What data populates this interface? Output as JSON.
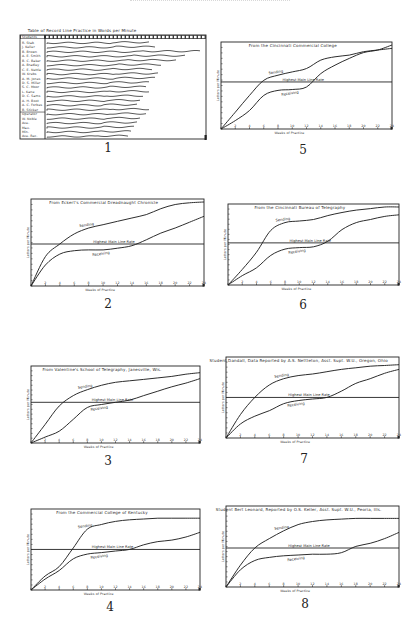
{
  "page": {
    "figure_numbers": [
      "1",
      "2",
      "3",
      "4",
      "5",
      "6",
      "7",
      "8"
    ]
  },
  "chart_data": [
    {
      "id": "fig1",
      "number": "1",
      "type": "table",
      "title": "Table of Record Line Practice in Words per Minute",
      "columns_header": "Students",
      "rows": [
        "R. Stab",
        "J. Keller",
        "B. Brown",
        "A. E. Smith",
        "B. C. Baker",
        "A. Bradley",
        "C. E. Nettle",
        "W. Krebs",
        "A. M. Jones",
        "D. S. Miller",
        "S. C. Moor",
        "L. Kane",
        "D. C. Sams",
        "A. H. Boot",
        "A. C. Forbes",
        "B. Sticker",
        "Operator",
        "W. Noble",
        "Ave.",
        "Max.",
        "Min.",
        "Ave. Rec."
      ],
      "note": "Wavy traces per student showing daily practice records across weeks"
    },
    {
      "id": "fig5",
      "number": "5",
      "type": "line",
      "title": "From the Cincinnati Commercial College",
      "xlabel": "Weeks of Practice",
      "ylabel": "Letters per Minute",
      "x": [
        0,
        1,
        2,
        3,
        4,
        5,
        6,
        7,
        8,
        9,
        10,
        11,
        12
      ],
      "threshold_label": "Highest Main Line Rate",
      "threshold": 56,
      "series": [
        {
          "name": "Sending",
          "values": [
            0,
            20,
            40,
            58,
            64,
            68,
            72,
            82,
            86,
            88,
            92,
            94,
            96
          ]
        },
        {
          "name": "Receiving",
          "values": [
            0,
            10,
            22,
            40,
            46,
            47,
            50,
            66,
            76,
            84,
            91,
            94,
            100
          ]
        }
      ],
      "ylim": [
        0,
        100
      ]
    },
    {
      "id": "fig2",
      "number": "2",
      "type": "line",
      "title": "From Eckert's Commercial Dreadnaught Chronicle",
      "xlabel": "Weeks of Practice",
      "ylabel": "Letters per Minute",
      "x": [
        0,
        1,
        2,
        3,
        4,
        5,
        6,
        7,
        8,
        9,
        10,
        11,
        12
      ],
      "threshold_label": "Highest Main Line Rate",
      "threshold": 50,
      "series": [
        {
          "name": "Sending",
          "values": [
            0,
            35,
            50,
            62,
            69,
            73,
            77,
            81,
            85,
            92,
            97,
            99,
            100
          ]
        },
        {
          "name": "Receiving",
          "values": [
            0,
            25,
            38,
            42,
            43,
            43,
            45,
            48,
            55,
            63,
            69,
            76,
            83
          ]
        }
      ],
      "ylim": [
        0,
        100
      ]
    },
    {
      "id": "fig6",
      "number": "6",
      "type": "line",
      "title": "From the Cincinnati Bureau of Telegraphy",
      "xlabel": "Weeks of Practice",
      "ylabel": "Letters per Minute",
      "x": [
        0,
        1,
        2,
        3,
        4,
        5,
        6,
        7,
        8,
        9,
        10,
        11,
        12
      ],
      "threshold_label": "Highest Main Line Rate",
      "threshold": 54,
      "series": [
        {
          "name": "Sending",
          "values": [
            0,
            20,
            42,
            70,
            80,
            82,
            84,
            89,
            93,
            96,
            98,
            100,
            100
          ]
        },
        {
          "name": "Receiving",
          "values": [
            0,
            12,
            22,
            38,
            46,
            48,
            49,
            56,
            71,
            80,
            84,
            88,
            90
          ]
        }
      ],
      "ylim": [
        0,
        100
      ]
    },
    {
      "id": "fig3",
      "number": "3",
      "type": "line",
      "title": "From Valentine's School of Telegraphy, Janesville, Wis.",
      "xlabel": "Weeks of Practice",
      "ylabel": "Letters per Minute",
      "x": [
        0,
        1,
        2,
        3,
        4,
        5,
        6,
        7,
        8,
        9,
        10,
        11,
        12
      ],
      "threshold_label": "Highest Main Line Rate",
      "threshold": 55,
      "series": [
        {
          "name": "Sending",
          "values": [
            0,
            25,
            50,
            64,
            72,
            78,
            82,
            84,
            86,
            88,
            90,
            93,
            95
          ]
        },
        {
          "name": "Receiving",
          "values": [
            0,
            8,
            16,
            32,
            48,
            52,
            55,
            58,
            64,
            70,
            76,
            81,
            87
          ]
        }
      ],
      "ylim": [
        0,
        100
      ]
    },
    {
      "id": "fig7",
      "number": "7",
      "type": "line",
      "title": "Student Dandall, Data Reported by A.S. Nettleton, Asst. Supt. W.U., Oregon, Ohio",
      "xlabel": "Weeks of Practice",
      "ylabel": "Letters per Minute",
      "x": [
        0,
        1,
        2,
        3,
        4,
        5,
        6,
        7,
        8,
        9,
        10,
        11,
        12
      ],
      "threshold_label": "Highest Main Line Rate",
      "threshold": 52,
      "series": [
        {
          "name": "Sending",
          "values": [
            0,
            30,
            52,
            68,
            76,
            80,
            82,
            85,
            88,
            90,
            92,
            93,
            94
          ]
        },
        {
          "name": "Receiving",
          "values": [
            0,
            18,
            28,
            35,
            44,
            48,
            50,
            52,
            60,
            70,
            76,
            83,
            88
          ]
        }
      ],
      "ylim": [
        0,
        100
      ]
    },
    {
      "id": "fig4",
      "number": "4",
      "type": "line",
      "title": "From the Commercial College of Kentucky",
      "xlabel": "Weeks of Practice",
      "ylabel": "Letters per Minute",
      "x": [
        0,
        1,
        2,
        3,
        4,
        5,
        6,
        7,
        8,
        9,
        10,
        11,
        12
      ],
      "threshold_label": "Highest Main Line Rate",
      "threshold": 52,
      "series": [
        {
          "name": "Sending",
          "values": [
            0,
            18,
            30,
            54,
            78,
            84,
            88,
            90,
            91,
            92,
            92,
            92,
            92
          ]
        },
        {
          "name": "Receiving",
          "values": [
            0,
            14,
            25,
            40,
            46,
            48,
            50,
            52,
            58,
            62,
            64,
            68,
            74
          ]
        }
      ],
      "ylim": [
        0,
        100
      ]
    },
    {
      "id": "fig8",
      "number": "8",
      "type": "line",
      "title": "Student Bert Leonard, Reported by O.S. Keller, Asst. Supt. W.U., Peoria, Ills.",
      "xlabel": "Weeks of Practice",
      "ylabel": "Letters per Minute",
      "x": [
        0,
        1,
        2,
        3,
        4,
        5,
        6,
        7,
        8,
        9,
        10,
        11,
        12
      ],
      "threshold_label": "Highest Main Line Rate",
      "threshold": 50,
      "series": [
        {
          "name": "Sending",
          "values": [
            0,
            28,
            50,
            62,
            72,
            80,
            84,
            86,
            87,
            88,
            88,
            88,
            88
          ]
        },
        {
          "name": "Receiving",
          "values": [
            0,
            22,
            34,
            38,
            40,
            41,
            42,
            42,
            44,
            52,
            56,
            62,
            70
          ]
        }
      ],
      "ylim": [
        0,
        100
      ]
    }
  ]
}
